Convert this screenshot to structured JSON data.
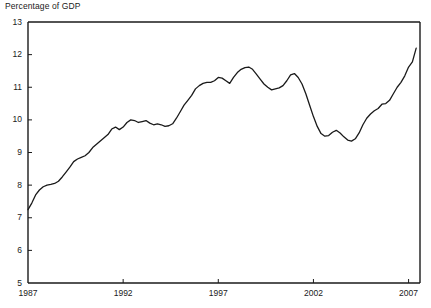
{
  "chart_data": {
    "type": "line",
    "title": "Percentage of GDP",
    "xlabel": "",
    "ylabel": "Percentage of GDP",
    "grid": false,
    "legend": "none",
    "ylim": [
      5,
      13
    ],
    "yticks": [
      5,
      6,
      7,
      8,
      9,
      10,
      11,
      12,
      13
    ],
    "ytick_labels": [
      "5",
      "6",
      "7",
      "8",
      "9",
      "10",
      "11",
      "12",
      "13"
    ],
    "xlim": [
      1987,
      2007.6
    ],
    "xticks": [
      1987,
      1992,
      1997,
      2002,
      2007
    ],
    "xtick_labels": [
      "1987",
      "1992",
      "1997",
      "2002",
      "2007"
    ],
    "line_color": "#1a1a1a",
    "series": [
      {
        "name": "Percentage of GDP",
        "x": [
          1987.0,
          1987.2,
          1987.4,
          1987.6,
          1987.8,
          1988.0,
          1988.2,
          1988.4,
          1988.6,
          1988.8,
          1989.0,
          1989.2,
          1989.4,
          1989.6,
          1989.8,
          1990.0,
          1990.2,
          1990.4,
          1990.6,
          1990.8,
          1991.0,
          1991.2,
          1991.4,
          1991.6,
          1991.8,
          1992.0,
          1992.2,
          1992.4,
          1992.6,
          1992.8,
          1993.0,
          1993.2,
          1993.4,
          1993.6,
          1993.8,
          1994.0,
          1994.2,
          1994.4,
          1994.6,
          1994.8,
          1995.0,
          1995.2,
          1995.4,
          1995.6,
          1995.8,
          1996.0,
          1996.2,
          1996.4,
          1996.6,
          1996.8,
          1997.0,
          1997.2,
          1997.4,
          1997.6,
          1997.8,
          1998.0,
          1998.2,
          1998.4,
          1998.6,
          1998.8,
          1999.0,
          1999.2,
          1999.4,
          1999.6,
          1999.8,
          2000.0,
          2000.2,
          2000.4,
          2000.6,
          2000.8,
          2001.0,
          2001.2,
          2001.4,
          2001.6,
          2001.8,
          2002.0,
          2002.2,
          2002.4,
          2002.6,
          2002.8,
          2003.0,
          2003.2,
          2003.4,
          2003.6,
          2003.8,
          2004.0,
          2004.2,
          2004.4,
          2004.6,
          2004.8,
          2005.0,
          2005.2,
          2005.4,
          2005.6,
          2005.8,
          2006.0,
          2006.2,
          2006.4,
          2006.6,
          2006.8,
          2007.0,
          2007.2,
          2007.4
        ],
        "y": [
          7.25,
          7.45,
          7.7,
          7.85,
          7.95,
          8.0,
          8.02,
          8.05,
          8.12,
          8.25,
          8.4,
          8.55,
          8.72,
          8.8,
          8.85,
          8.9,
          9.0,
          9.15,
          9.25,
          9.35,
          9.45,
          9.55,
          9.72,
          9.78,
          9.7,
          9.78,
          9.92,
          10.0,
          9.98,
          9.92,
          9.95,
          9.98,
          9.9,
          9.85,
          9.88,
          9.85,
          9.8,
          9.82,
          9.88,
          10.05,
          10.25,
          10.45,
          10.6,
          10.75,
          10.95,
          11.05,
          11.12,
          11.15,
          11.15,
          11.2,
          11.3,
          11.28,
          11.2,
          11.12,
          11.3,
          11.45,
          11.55,
          11.6,
          11.62,
          11.55,
          11.4,
          11.25,
          11.1,
          11.0,
          10.92,
          10.95,
          10.98,
          11.05,
          11.2,
          11.38,
          11.42,
          11.3,
          11.1,
          10.8,
          10.45,
          10.1,
          9.8,
          9.58,
          9.5,
          9.52,
          9.62,
          9.68,
          9.6,
          9.48,
          9.38,
          9.35,
          9.42,
          9.6,
          9.85,
          10.05,
          10.18,
          10.28,
          10.35,
          10.48,
          10.5,
          10.6,
          10.8,
          11.0,
          11.15,
          11.35,
          11.62,
          11.78,
          12.2
        ]
      }
    ]
  },
  "plot": {
    "left": 28,
    "right": 420,
    "top": 22,
    "bottom": 283
  }
}
